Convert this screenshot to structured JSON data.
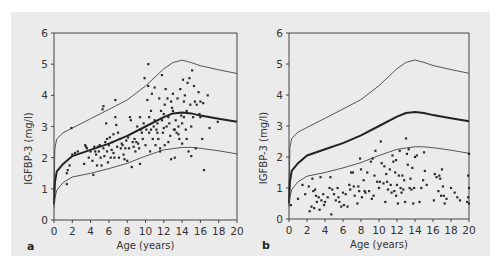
{
  "chart_data": [
    {
      "panel": "a",
      "type": "scatter",
      "xlabel": "Age (years)",
      "ylabel": "IGFBP-3 (mg/l)",
      "xlim": [
        0,
        20
      ],
      "ylim": [
        0,
        6
      ],
      "xticks": [
        0,
        2,
        4,
        6,
        8,
        10,
        12,
        14,
        16,
        18,
        20
      ],
      "yticks": [
        0,
        1,
        2,
        3,
        4,
        5,
        6
      ],
      "grid": false,
      "reference_curves": [
        {
          "name": "upper",
          "style": "thin",
          "points": [
            [
              0,
              0.9
            ],
            [
              0.1,
              2.3
            ],
            [
              0.3,
              2.6
            ],
            [
              1,
              2.8
            ],
            [
              2,
              2.95
            ],
            [
              4,
              3.25
            ],
            [
              6,
              3.55
            ],
            [
              8,
              3.85
            ],
            [
              10,
              4.3
            ],
            [
              12,
              4.85
            ],
            [
              13,
              5.05
            ],
            [
              14,
              5.13
            ],
            [
              15,
              5.05
            ],
            [
              16,
              4.95
            ],
            [
              18,
              4.82
            ],
            [
              20,
              4.7
            ]
          ]
        },
        {
          "name": "median",
          "style": "thick",
          "points": [
            [
              0,
              0.5
            ],
            [
              0.1,
              1.2
            ],
            [
              0.3,
              1.55
            ],
            [
              1,
              1.8
            ],
            [
              2,
              2.05
            ],
            [
              4,
              2.25
            ],
            [
              6,
              2.45
            ],
            [
              8,
              2.7
            ],
            [
              10,
              3.0
            ],
            [
              12,
              3.3
            ],
            [
              13,
              3.42
            ],
            [
              14,
              3.45
            ],
            [
              15,
              3.42
            ],
            [
              16,
              3.35
            ],
            [
              18,
              3.25
            ],
            [
              20,
              3.15
            ]
          ]
        },
        {
          "name": "lower",
          "style": "thin",
          "points": [
            [
              0,
              0.4
            ],
            [
              0.1,
              0.7
            ],
            [
              0.3,
              0.95
            ],
            [
              1,
              1.2
            ],
            [
              2,
              1.38
            ],
            [
              4,
              1.5
            ],
            [
              6,
              1.65
            ],
            [
              8,
              1.82
            ],
            [
              10,
              2.05
            ],
            [
              12,
              2.25
            ],
            [
              14,
              2.33
            ],
            [
              15,
              2.33
            ],
            [
              16,
              2.3
            ],
            [
              18,
              2.22
            ],
            [
              20,
              2.12
            ]
          ]
        }
      ],
      "points": [
        [
          1.4,
          1.15
        ],
        [
          1.4,
          1.5
        ],
        [
          1.5,
          1.6
        ],
        [
          1.7,
          1.75
        ],
        [
          1.9,
          2.95
        ],
        [
          2.3,
          2.15
        ],
        [
          2.6,
          2.2
        ],
        [
          3.3,
          1.8
        ],
        [
          3.4,
          2.4
        ],
        [
          3.6,
          2.3
        ],
        [
          3.8,
          2.0
        ],
        [
          4.0,
          2.2
        ],
        [
          4.2,
          1.9
        ],
        [
          4.3,
          1.45
        ],
        [
          4.4,
          2.35
        ],
        [
          4.6,
          2.1
        ],
        [
          4.7,
          1.75
        ],
        [
          4.9,
          2.2
        ],
        [
          5.0,
          2.4
        ],
        [
          5.1,
          2.0
        ],
        [
          5.2,
          1.75
        ],
        [
          5.3,
          3.55
        ],
        [
          5.4,
          3.65
        ],
        [
          5.4,
          2.3
        ],
        [
          5.6,
          2.5
        ],
        [
          5.7,
          3.1
        ],
        [
          5.8,
          2.2
        ],
        [
          5.9,
          1.85
        ],
        [
          6.0,
          2.4
        ],
        [
          6.1,
          2.65
        ],
        [
          6.2,
          2.0
        ],
        [
          6.4,
          2.5
        ],
        [
          6.5,
          2.75
        ],
        [
          6.6,
          2.0
        ],
        [
          6.7,
          3.85
        ],
        [
          6.7,
          3.3
        ],
        [
          6.8,
          3.05
        ],
        [
          6.9,
          2.35
        ],
        [
          7.0,
          2.8
        ],
        [
          7.1,
          2.0
        ],
        [
          7.2,
          2.6
        ],
        [
          7.4,
          2.45
        ],
        [
          7.6,
          2.1
        ],
        [
          7.7,
          1.95
        ],
        [
          7.8,
          2.3
        ],
        [
          7.9,
          2.55
        ],
        [
          8.0,
          1.9
        ],
        [
          8.2,
          2.3
        ],
        [
          8.3,
          3.3
        ],
        [
          8.4,
          3.2
        ],
        [
          8.5,
          1.7
        ],
        [
          8.6,
          2.5
        ],
        [
          8.8,
          2.6
        ],
        [
          8.9,
          2.2
        ],
        [
          9.0,
          2.5
        ],
        [
          9.1,
          3.0
        ],
        [
          9.3,
          2.3
        ],
        [
          9.4,
          1.8
        ],
        [
          9.4,
          3.3
        ],
        [
          9.6,
          2.8
        ],
        [
          9.7,
          2.6
        ],
        [
          9.8,
          3.1
        ],
        [
          9.9,
          4.55
        ],
        [
          10.0,
          2.4
        ],
        [
          10.1,
          2.9
        ],
        [
          10.2,
          3.85
        ],
        [
          10.3,
          5.0
        ],
        [
          10.3,
          4.3
        ],
        [
          10.4,
          3.3
        ],
        [
          10.5,
          2.2
        ],
        [
          10.6,
          2.9
        ],
        [
          10.7,
          4.05
        ],
        [
          10.8,
          2.6
        ],
        [
          10.9,
          3.0
        ],
        [
          11.0,
          4.25
        ],
        [
          11.1,
          2.4
        ],
        [
          11.2,
          2.9
        ],
        [
          11.3,
          3.1
        ],
        [
          11.4,
          2.6
        ],
        [
          11.5,
          3.9
        ],
        [
          11.6,
          2.2
        ],
        [
          11.6,
          2.3
        ],
        [
          11.7,
          3.5
        ],
        [
          11.8,
          4.65
        ],
        [
          11.9,
          2.8
        ],
        [
          12.0,
          3.4
        ],
        [
          12.1,
          3.7
        ],
        [
          12.1,
          2.4
        ],
        [
          12.2,
          4.2
        ],
        [
          12.3,
          3.0
        ],
        [
          12.4,
          3.9
        ],
        [
          12.5,
          2.5
        ],
        [
          12.6,
          3.1
        ],
        [
          12.7,
          2.7
        ],
        [
          12.8,
          1.95
        ],
        [
          12.9,
          3.6
        ],
        [
          13.0,
          4.05
        ],
        [
          13.1,
          2.9
        ],
        [
          13.2,
          2.0
        ],
        [
          13.3,
          3.2
        ],
        [
          13.4,
          2.8
        ],
        [
          13.5,
          3.9
        ],
        [
          13.6,
          3.0
        ],
        [
          13.7,
          2.6
        ],
        [
          13.8,
          4.2
        ],
        [
          13.9,
          3.35
        ],
        [
          14.0,
          2.45
        ],
        [
          14.1,
          4.5
        ],
        [
          14.2,
          3.8
        ],
        [
          14.3,
          4.0
        ],
        [
          14.4,
          2.9
        ],
        [
          14.5,
          3.5
        ],
        [
          14.6,
          4.4
        ],
        [
          14.7,
          2.2
        ],
        [
          14.8,
          4.55
        ],
        [
          14.9,
          3.7
        ],
        [
          15.0,
          2.05
        ],
        [
          15.1,
          4.8
        ],
        [
          15.2,
          3.3
        ],
        [
          15.3,
          4.3
        ],
        [
          15.4,
          3.8
        ],
        [
          15.5,
          2.3
        ],
        [
          15.6,
          3.7
        ],
        [
          15.8,
          4.1
        ],
        [
          15.9,
          3.4
        ],
        [
          16.0,
          3.8
        ],
        [
          16.2,
          2.6
        ],
        [
          16.3,
          3.75
        ],
        [
          16.4,
          1.6
        ],
        [
          16.8,
          4.0
        ],
        [
          17.0,
          2.95
        ],
        [
          17.9,
          3.15
        ],
        [
          2.0,
          2.1
        ],
        [
          3.5,
          2.35
        ],
        [
          4.5,
          2.2
        ],
        [
          5.5,
          2.05
        ],
        [
          6.3,
          2.25
        ],
        [
          7.3,
          2.3
        ],
        [
          8.1,
          2.65
        ],
        [
          9.2,
          2.45
        ],
        [
          10.4,
          2.8
        ],
        [
          11.0,
          3.2
        ],
        [
          11.3,
          2.8
        ],
        [
          12.0,
          2.95
        ],
        [
          12.5,
          3.3
        ],
        [
          13.2,
          2.9
        ],
        [
          13.6,
          2.75
        ],
        [
          14.0,
          3.1
        ],
        [
          14.5,
          2.6
        ],
        [
          15.0,
          3.0
        ],
        [
          16.0,
          3.3
        ],
        [
          10.6,
          3.5
        ],
        [
          9.5,
          2.9
        ],
        [
          8.7,
          2.35
        ],
        [
          7.5,
          2.4
        ],
        [
          6.5,
          2.15
        ],
        [
          5.8,
          2.6
        ],
        [
          4.8,
          2.35
        ],
        [
          13.0,
          3.5
        ],
        [
          14.2,
          3.3
        ],
        [
          12.8,
          3.8
        ],
        [
          11.8,
          3.2
        ]
      ]
    },
    {
      "panel": "b",
      "type": "scatter",
      "xlabel": "Age (years)",
      "ylabel": "IGFBP-3 (mg/l)",
      "xlim": [
        0,
        20
      ],
      "ylim": [
        0,
        6
      ],
      "xticks": [
        0,
        2,
        4,
        6,
        8,
        10,
        12,
        14,
        16,
        18,
        20
      ],
      "yticks": [
        0,
        1,
        2,
        3,
        4,
        5,
        6
      ],
      "grid": false,
      "reference_curves": "same as panel a",
      "points": [
        [
          0.2,
          0.45
        ],
        [
          1.0,
          0.65
        ],
        [
          1.5,
          1.1
        ],
        [
          1.8,
          0.8
        ],
        [
          2.2,
          1.05
        ],
        [
          2.3,
          0.25
        ],
        [
          2.5,
          0.4
        ],
        [
          2.6,
          1.3
        ],
        [
          2.7,
          0.9
        ],
        [
          2.8,
          0.35
        ],
        [
          3.0,
          0.75
        ],
        [
          3.1,
          0.55
        ],
        [
          3.3,
          0.7
        ],
        [
          3.4,
          0.3
        ],
        [
          3.5,
          1.35
        ],
        [
          3.6,
          0.6
        ],
        [
          3.8,
          0.8
        ],
        [
          4.0,
          0.55
        ],
        [
          4.3,
          0.7
        ],
        [
          4.5,
          1.0
        ],
        [
          4.6,
          1.35
        ],
        [
          4.7,
          0.15
        ],
        [
          4.8,
          0.95
        ],
        [
          5.0,
          0.8
        ],
        [
          5.2,
          0.6
        ],
        [
          5.4,
          1.0
        ],
        [
          5.6,
          0.55
        ],
        [
          5.8,
          0.4
        ],
        [
          6.0,
          0.85
        ],
        [
          6.1,
          0.45
        ],
        [
          6.3,
          0.8
        ],
        [
          6.5,
          0.4
        ],
        [
          6.7,
          1.1
        ],
        [
          6.9,
          1.5
        ],
        [
          7.1,
          1.5
        ],
        [
          7.3,
          0.75
        ],
        [
          7.6,
          0.5
        ],
        [
          7.7,
          1.05
        ],
        [
          7.8,
          0.9
        ],
        [
          7.9,
          1.95
        ],
        [
          8.0,
          1.6
        ],
        [
          8.1,
          0.7
        ],
        [
          8.3,
          1.25
        ],
        [
          8.5,
          0.85
        ],
        [
          8.7,
          1.5
        ],
        [
          8.9,
          0.9
        ],
        [
          9.1,
          1.85
        ],
        [
          9.2,
          0.65
        ],
        [
          9.3,
          1.95
        ],
        [
          9.5,
          1.4
        ],
        [
          9.6,
          2.2
        ],
        [
          9.8,
          1.2
        ],
        [
          10.0,
          1.0
        ],
        [
          10.1,
          1.2
        ],
        [
          10.2,
          2.5
        ],
        [
          10.3,
          1.8
        ],
        [
          10.5,
          1.15
        ],
        [
          10.7,
          0.55
        ],
        [
          10.8,
          1.45
        ],
        [
          10.9,
          1.2
        ],
        [
          11.0,
          0.95
        ],
        [
          11.2,
          1.6
        ],
        [
          11.4,
          0.85
        ],
        [
          11.5,
          2.05
        ],
        [
          11.6,
          1.85
        ],
        [
          11.7,
          0.9
        ],
        [
          11.8,
          1.5
        ],
        [
          11.9,
          0.75
        ],
        [
          12.0,
          1.1
        ],
        [
          12.1,
          0.5
        ],
        [
          12.2,
          1.4
        ],
        [
          12.3,
          2.2
        ],
        [
          12.4,
          1.0
        ],
        [
          12.6,
          1.4
        ],
        [
          12.7,
          0.95
        ],
        [
          12.8,
          1.25
        ],
        [
          12.9,
          0.55
        ],
        [
          13.0,
          2.6
        ],
        [
          13.1,
          2.1
        ],
        [
          13.2,
          1.75
        ],
        [
          13.3,
          2.25
        ],
        [
          13.5,
          1.3
        ],
        [
          13.6,
          0.95
        ],
        [
          13.7,
          1.65
        ],
        [
          13.8,
          0.5
        ],
        [
          14.0,
          2.0
        ],
        [
          14.2,
          2.05
        ],
        [
          14.5,
          0.55
        ],
        [
          14.7,
          1.0
        ],
        [
          14.9,
          1.25
        ],
        [
          15.0,
          2.15
        ],
        [
          15.1,
          1.55
        ],
        [
          16.1,
          0.6
        ],
        [
          16.2,
          1.45
        ],
        [
          16.4,
          1.35
        ],
        [
          16.6,
          0.9
        ],
        [
          16.7,
          1.4
        ],
        [
          16.8,
          1.3
        ],
        [
          17.0,
          1.6
        ],
        [
          17.1,
          1.05
        ],
        [
          17.2,
          0.75
        ],
        [
          17.3,
          0.5
        ],
        [
          17.5,
          0.65
        ],
        [
          18.0,
          1.0
        ],
        [
          18.4,
          0.85
        ],
        [
          19.0,
          0.6
        ],
        [
          19.8,
          0.55
        ],
        [
          19.9,
          1.4
        ],
        [
          20.0,
          2.1
        ],
        [
          20.0,
          1.0
        ],
        [
          19.9,
          0.7
        ],
        [
          20.0,
          0.5
        ],
        [
          2.9,
          0.95
        ],
        [
          3.9,
          0.45
        ],
        [
          5.5,
          0.7
        ],
        [
          6.8,
          0.95
        ],
        [
          8.4,
          0.9
        ],
        [
          9.4,
          0.75
        ],
        [
          11.3,
          1.1
        ],
        [
          12.5,
          0.85
        ],
        [
          13.4,
          1.0
        ],
        [
          15.3,
          1.1
        ],
        [
          16.9,
          0.75
        ],
        [
          18.7,
          0.7
        ],
        [
          7.2,
          1.05
        ],
        [
          10.6,
          1.7
        ],
        [
          11.9,
          1.9
        ],
        [
          13.9,
          1.0
        ]
      ]
    }
  ],
  "panels": {
    "a": {
      "letter": "a",
      "xlabel": "Age (years)",
      "ylabel": "IGFBP-3 (mg/l)"
    },
    "b": {
      "letter": "b",
      "xlabel": "Age (years)",
      "ylabel": "IGFBP-3 (mg/l)"
    }
  },
  "colors": {
    "background": "#ebebeb",
    "axis": "#444444",
    "curve": "#444444",
    "median": "#222222",
    "point": "#2a2a2a"
  }
}
